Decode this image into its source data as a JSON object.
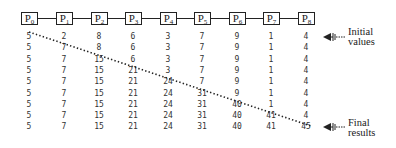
{
  "diagram": {
    "processors": [
      "P0",
      "P1",
      "P2",
      "P3",
      "P4",
      "P5",
      "P6",
      "P7",
      "P8"
    ],
    "processor_base": "P",
    "rows": [
      [
        5,
        2,
        8,
        6,
        3,
        7,
        9,
        1,
        4
      ],
      [
        5,
        7,
        8,
        6,
        3,
        7,
        9,
        1,
        4
      ],
      [
        5,
        7,
        15,
        6,
        3,
        7,
        9,
        1,
        4
      ],
      [
        5,
        7,
        15,
        21,
        3,
        7,
        9,
        1,
        4
      ],
      [
        5,
        7,
        15,
        21,
        24,
        7,
        9,
        1,
        4
      ],
      [
        5,
        7,
        15,
        21,
        24,
        31,
        9,
        1,
        4
      ],
      [
        5,
        7,
        15,
        21,
        24,
        31,
        40,
        1,
        4
      ],
      [
        5,
        7,
        15,
        21,
        24,
        31,
        40,
        41,
        4
      ],
      [
        5,
        7,
        15,
        21,
        24,
        31,
        40,
        41,
        45
      ]
    ],
    "annotations": {
      "initial": {
        "line1": "Initial",
        "line2": "values",
        "icon": "arrow-left-icon"
      },
      "final": {
        "line1": "Final",
        "line2": "results",
        "icon": "arrow-left-icon"
      }
    },
    "colors": {
      "ink": "#222222",
      "numbers": "#333333",
      "background": "#ffffff"
    }
  }
}
